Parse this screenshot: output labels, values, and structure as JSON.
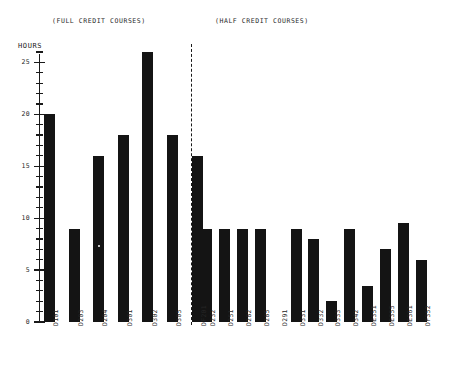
{
  "axis_title": "HOURS",
  "sections": {
    "left_header": "(FULL CREDIT COURSES)",
    "right_header": "(HALF CREDIT COURSES)"
  },
  "chart_data": {
    "type": "bar",
    "title": "",
    "xlabel": "",
    "ylabel": "HOURS",
    "ylim": [
      0,
      26
    ],
    "ytick_labels": [
      "0",
      "5",
      "10",
      "15",
      "20",
      "25"
    ],
    "ytick_values": [
      0,
      5,
      10,
      15,
      20,
      25
    ],
    "minor_tick_step": 1,
    "grid": false,
    "legend": "none",
    "groups": [
      {
        "name": "(FULL CREDIT COURSES)",
        "categories": [
          "D101",
          "D203",
          "D204",
          "D301",
          "D302",
          "D305",
          "DF201"
        ],
        "values": [
          20,
          9,
          16,
          18,
          26,
          18,
          16
        ]
      },
      {
        "name": "(HALF CREDIT COURSES)",
        "categories": [
          "D232",
          "D251",
          "D282",
          "D285",
          "D291",
          "D331",
          "D332",
          "D333",
          "D342",
          "DE351",
          "DE355",
          "DE361",
          "DF352"
        ],
        "values": [
          9,
          9,
          9,
          9,
          0,
          9,
          8,
          2,
          9,
          3.5,
          7,
          9.5,
          6
        ]
      }
    ],
    "categories": [
      "D101",
      "D203",
      "D204",
      "D301",
      "D302",
      "D305",
      "DF201",
      "D232",
      "D251",
      "D282",
      "D285",
      "D291",
      "D331",
      "D332",
      "D333",
      "D342",
      "DE351",
      "DE355",
      "DE361",
      "DF352"
    ],
    "values": [
      20,
      9,
      16,
      18,
      26,
      18,
      16,
      9,
      9,
      9,
      9,
      0,
      9,
      8,
      2,
      9,
      3.5,
      7,
      9.5,
      6
    ],
    "bar_color": "#141414",
    "divider": {
      "style": "dashed",
      "orientation": "vertical",
      "separates": [
        "(FULL CREDIT COURSES)",
        "(HALF CREDIT COURSES)"
      ]
    }
  },
  "layout": {
    "baseline_y": 322,
    "px_per_unit": 10.3846,
    "bar_width": 11,
    "bar_x": [
      44,
      70,
      95,
      120,
      145,
      169,
      170.5,
      201,
      226,
      250,
      274,
      298,
      322,
      346,
      370,
      382,
      394,
      406,
      430
    ],
    "label_y": 326
  }
}
